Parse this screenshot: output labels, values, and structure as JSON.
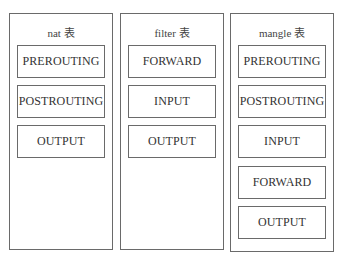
{
  "tables": [
    {
      "title": "nat 表",
      "chains": [
        "PREROUTING",
        "POSTROUTING",
        "OUTPUT"
      ]
    },
    {
      "title": "filter 表",
      "chains": [
        "FORWARD",
        "INPUT",
        "OUTPUT"
      ]
    },
    {
      "title": "mangle 表",
      "chains": [
        "PREROUTING",
        "POSTROUTING",
        "INPUT",
        "FORWARD",
        "OUTPUT"
      ]
    }
  ]
}
